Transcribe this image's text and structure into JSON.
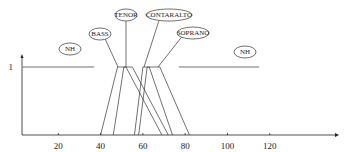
{
  "chart_data": {
    "type": "line",
    "title": "",
    "xlabel": "",
    "ylabel": "",
    "xlim": [
      0,
      145
    ],
    "ylim": [
      0,
      1
    ],
    "x_ticks": [
      20,
      40,
      60,
      80,
      100,
      120
    ],
    "y_ticks": [
      1
    ],
    "grid": false,
    "series": [
      {
        "name": "NH",
        "points": [
          [
            3,
            1
          ],
          [
            37,
            1
          ]
        ]
      },
      {
        "name": "BASS",
        "points": [
          [
            40,
            0
          ],
          [
            48,
            1
          ],
          [
            52,
            1
          ],
          [
            69,
            0
          ]
        ]
      },
      {
        "name": "TENOR",
        "points": [
          [
            46,
            0
          ],
          [
            51,
            1
          ],
          [
            55,
            1
          ],
          [
            72,
            0
          ]
        ]
      },
      {
        "name": "CONTRALTO",
        "points": [
          [
            56,
            0
          ],
          [
            60,
            1
          ],
          [
            63,
            1
          ],
          [
            74,
            0
          ]
        ]
      },
      {
        "name": "SOPRANO",
        "points": [
          [
            58,
            0
          ],
          [
            62,
            1
          ],
          [
            68,
            1
          ],
          [
            82,
            0
          ]
        ]
      },
      {
        "name": "NH",
        "points": [
          [
            77,
            1
          ],
          [
            115,
            1
          ]
        ]
      }
    ],
    "annotations": [
      {
        "text": "NH",
        "target": "NH"
      },
      {
        "text": "BASS",
        "target": "BASS"
      },
      {
        "text": "TENOR",
        "target": "TENOR"
      },
      {
        "text": "CONTARALTO",
        "target": "CONTRALTO"
      },
      {
        "text": "SOPRANO",
        "target": "SOPRANO"
      },
      {
        "text": "NH",
        "target": "NH"
      }
    ]
  }
}
